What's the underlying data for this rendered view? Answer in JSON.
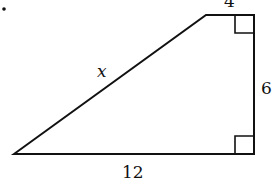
{
  "figure": {
    "shape": "right trapezoid",
    "labels": {
      "top": "4",
      "slant": "x",
      "right": "6",
      "bottom": "12"
    },
    "bullet": "•",
    "right_angles": 2
  }
}
